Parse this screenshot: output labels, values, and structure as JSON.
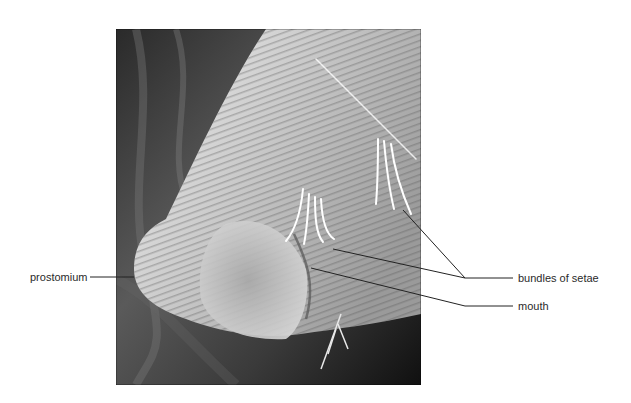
{
  "figure": {
    "labels": [
      {
        "id": "prostomium",
        "text": "prostomium"
      },
      {
        "id": "bundles-of-setae",
        "text": "bundles of setae"
      },
      {
        "id": "mouth",
        "text": "mouth"
      }
    ]
  }
}
